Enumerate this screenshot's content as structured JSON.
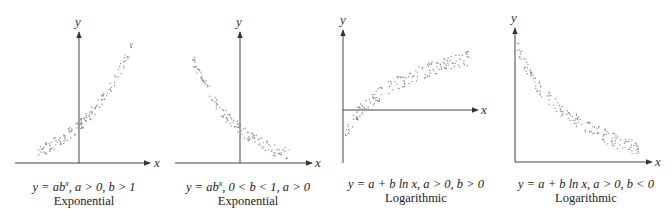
{
  "chart_data": [
    {
      "type": "scatter",
      "title": "Exponential",
      "equation": "y = ab^x, a > 0, b > 1",
      "xlabel": "x",
      "ylabel": "y",
      "trend": "increasing, convex",
      "grid": false,
      "legend": null
    },
    {
      "type": "scatter",
      "title": "Exponential",
      "equation": "y = ab^x, 0 < b < 1, a > 0",
      "xlabel": "x",
      "ylabel": "y",
      "trend": "decreasing, convex",
      "grid": false,
      "legend": null
    },
    {
      "type": "scatter",
      "title": "Logarithmic",
      "equation": "y = a + b ln x, a > 0, b > 0",
      "xlabel": "x",
      "ylabel": "y",
      "trend": "increasing, concave",
      "grid": false,
      "legend": null
    },
    {
      "type": "scatter",
      "title": "Logarithmic",
      "equation": "y = a + b ln x, a > 0, b < 0",
      "xlabel": "x",
      "ylabel": "y",
      "trend": "decreasing, convex",
      "grid": false,
      "legend": null
    }
  ],
  "panels": [
    {
      "eq_prefix": "y = ab",
      "eq_sup": "x",
      "eq_suffix": ", a > 0, b > 1",
      "name": "Exponential",
      "xlabel": "x",
      "ylabel": "y"
    },
    {
      "eq_prefix": "y = ab",
      "eq_sup": "x",
      "eq_suffix": ", 0 < b < 1, a > 0",
      "name": "Exponential",
      "xlabel": "x",
      "ylabel": "y"
    },
    {
      "eq_prefix": "y = a + b ln x, a > 0, b > 0",
      "eq_sup": "",
      "eq_suffix": "",
      "name": "Logarithmic",
      "xlabel": "x",
      "ylabel": "y"
    },
    {
      "eq_prefix": "y = a + b ln x, a > 0, b < 0",
      "eq_sup": "",
      "eq_suffix": "",
      "name": "Logarithmic",
      "xlabel": "x",
      "ylabel": "y"
    }
  ],
  "colors": {
    "axis": "#444444",
    "dots": "#8a8a8a",
    "text": "#222222"
  }
}
